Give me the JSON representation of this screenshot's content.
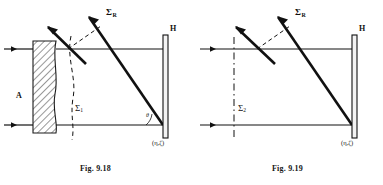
{
  "page": {
    "background": "#ffffff",
    "ink": "#111111"
  },
  "figures": [
    {
      "id": "fig-9-18",
      "caption": "Fig. 9.18",
      "labels": {
        "diffuser": "A",
        "reference_wavefront": "Σ",
        "reference_wavefront_sub": "R",
        "object_wavefront": "Σ",
        "object_wavefront_sub": "1",
        "hologram": "H",
        "angle": "θ",
        "coordinates": "(η,ζ)"
      },
      "elements": {
        "diffuser_present": true,
        "beam_count": 2,
        "ray_count": 2,
        "dashed_wavefront": "curved"
      }
    },
    {
      "id": "fig-9-19",
      "caption": "Fig. 9.19",
      "labels": {
        "reference_wavefront": "Σ",
        "reference_wavefront_sub": "R",
        "object_wavefront": "Σ",
        "object_wavefront_sub": "2",
        "hologram": "H",
        "coordinates": "(η,ζ)"
      },
      "elements": {
        "diffuser_present": false,
        "beam_count": 2,
        "ray_count": 2,
        "dashed_wavefront": "straight-vertical"
      }
    }
  ]
}
